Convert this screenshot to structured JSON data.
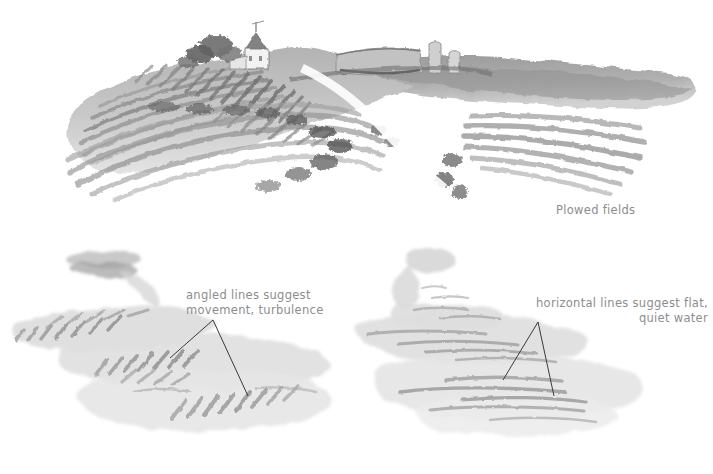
{
  "page": {
    "background_color": "#ffffff",
    "ink_color": "#8d8d8d",
    "leader_line_color": "#3a3a3a",
    "medium": "watercolor",
    "palette": {
      "wash_light": "#d8d8d8",
      "wash_mid": "#a8a8a8",
      "wash_dark": "#777777",
      "wash_deepest": "#4e4e4e",
      "water_wash": "#e2e2e2",
      "water_stroke": "#b9b9b9"
    }
  },
  "figures": [
    {
      "id": "plowed-fields",
      "name": "plowed-fields-study",
      "caption": "Plowed fields",
      "subject": "hillside farm with plowed furrows, farmhouse, barn and silos",
      "elements": [
        "farmhouse",
        "trees",
        "barn",
        "silo",
        "curved-furrows",
        "hedgerow"
      ]
    },
    {
      "id": "turbulent-water",
      "name": "turbulent-water-study",
      "annotation": "angled lines suggest\nmovement, turbulence",
      "subject": "moving water rendered with angled brush dashes",
      "stroke_direction": "angled"
    },
    {
      "id": "quiet-water",
      "name": "quiet-water-study",
      "annotation": "horizontal lines suggest flat,\nquiet water",
      "subject": "still water rendered with horizontal brush strokes",
      "stroke_direction": "horizontal"
    }
  ]
}
